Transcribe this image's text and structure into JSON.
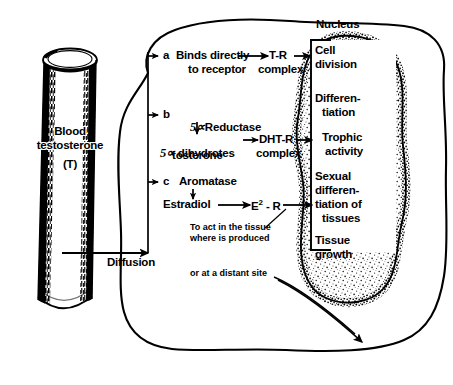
{
  "figure": {
    "vessel": {
      "name": "blood-vessel",
      "line1": "Blood",
      "line2": "testosterone",
      "line3": "(T)"
    },
    "diffusion_label": "Diffusion",
    "nucleus_label": "Nucleus",
    "pathways": [
      {
        "letter": "a",
        "enzyme": "",
        "lines": [
          "Binds directly",
          "to receptor"
        ],
        "product": "",
        "complex_lines": [
          "T-R",
          "complex"
        ]
      },
      {
        "letter": "b",
        "enzyme": "5∝Reductase",
        "lines": [
          "5∝ dihydrotes",
          "tosterone"
        ],
        "product": "5∝ dihydrotestosterone",
        "complex_lines": [
          "DHT-R",
          "complex"
        ]
      },
      {
        "letter": "c",
        "enzyme": "Aromatase",
        "lines": [
          "Estradiol"
        ],
        "product": "Estradiol",
        "complex_lines": [
          "E² - R"
        ]
      }
    ],
    "nucleus_effects": [
      [
        "Cell",
        "division"
      ],
      [
        "Differen-",
        "tiation"
      ],
      [
        "Trophic",
        "activity"
      ],
      [
        "Sexual",
        "differen-",
        "tiation of",
        "tissues"
      ],
      [
        "Tissue",
        "growth"
      ]
    ],
    "captions": {
      "local_action_line1": "To act in the tissue",
      "local_action_line2": "where is produced",
      "distant_action": "or at a distant site"
    },
    "colors": {
      "ink": "#000000",
      "paper": "#ffffff",
      "stipple": "#8a8a8a"
    }
  }
}
